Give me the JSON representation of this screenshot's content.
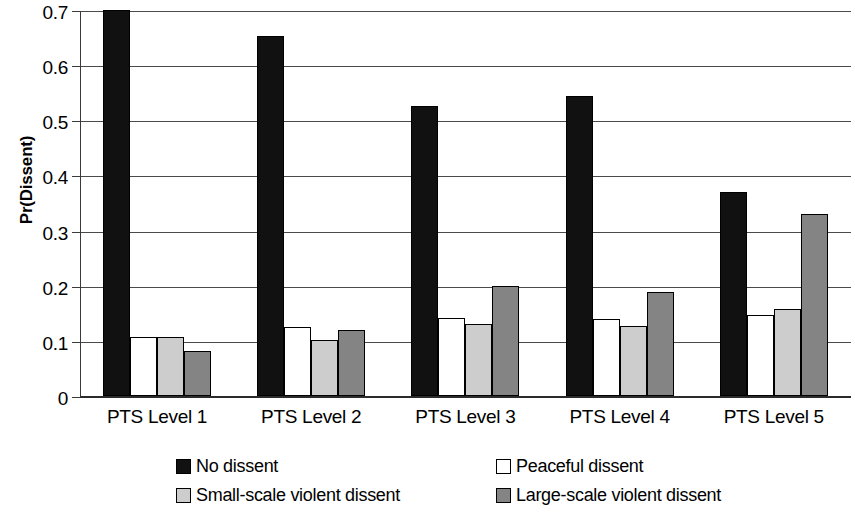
{
  "chart_data": {
    "type": "bar",
    "title": "",
    "subtitle": "",
    "xlabel": "",
    "ylabel": "Pr(Dissent)",
    "categories": [
      "PTS Level 1",
      "PTS Level 2",
      "PTS Level 3",
      "PTS Level 4",
      "PTS Level 5"
    ],
    "series": [
      {
        "name": "No dissent",
        "color": "#111111",
        "values": [
          0.703,
          0.656,
          0.528,
          0.546,
          0.372
        ]
      },
      {
        "name": "Peaceful dissent",
        "color": "#ffffff",
        "values": [
          0.108,
          0.125,
          0.143,
          0.141,
          0.147
        ]
      },
      {
        "name": "Small-scale violent dissent",
        "color": "#cdcdcd",
        "values": [
          0.107,
          0.103,
          0.132,
          0.128,
          0.158
        ]
      },
      {
        "name": "Large-scale violent dissent",
        "color": "#848484",
        "values": [
          0.082,
          0.121,
          0.2,
          0.189,
          0.332
        ]
      }
    ],
    "ylim": [
      0,
      0.7
    ],
    "y_ticks": [
      0,
      0.1,
      0.2,
      0.3,
      0.4,
      0.5,
      0.6,
      0.7
    ],
    "y_tick_labels": [
      "0",
      "0.1",
      "0.2",
      "0.3",
      "0.4",
      "0.5",
      "0.6",
      "0.7"
    ],
    "grid": "horizontal",
    "legend_position": "bottom",
    "legend": [
      {
        "label": "No dissent",
        "color": "#111111"
      },
      {
        "label": "Peaceful dissent",
        "color": "#ffffff"
      },
      {
        "label": "Small-scale violent dissent",
        "color": "#cdcdcd"
      },
      {
        "label": "Large-scale violent dissent",
        "color": "#848484"
      }
    ]
  }
}
